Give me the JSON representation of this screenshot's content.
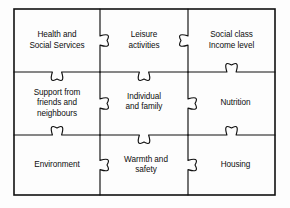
{
  "diagram": {
    "type": "jigsaw-puzzle",
    "rows": 3,
    "columns": 3,
    "frame": {
      "x": 14,
      "y": 9,
      "width": 261,
      "height": 186
    },
    "colors": {
      "stroke": "#111111",
      "background": "#ffffff",
      "text": "#0d0d0d"
    },
    "column_dividers_x": [
      100,
      188
    ],
    "row_dividers_y": [
      72,
      135
    ],
    "pieces": [
      {
        "id": "health-and-social-services",
        "label": "Health and\nSocial Services",
        "row": 0,
        "col": 0,
        "edges": {
          "top": "flat",
          "right": "tab",
          "bottom": "tab",
          "left": "flat"
        }
      },
      {
        "id": "leisure-activities",
        "label": "Leisure\nactivities",
        "row": 0,
        "col": 1,
        "edges": {
          "top": "flat",
          "right": "blank",
          "bottom": "tab",
          "left": "blank"
        }
      },
      {
        "id": "social-class-income-level",
        "label": "Social class\nIncome level",
        "row": 0,
        "col": 2,
        "edges": {
          "top": "flat",
          "right": "flat",
          "bottom": "blank",
          "left": "tab"
        }
      },
      {
        "id": "support-from-friends-and-neighbours",
        "label": "Support from\nfriends and\nneighbours",
        "row": 1,
        "col": 0,
        "edges": {
          "top": "blank",
          "right": "tab",
          "bottom": "blank",
          "left": "flat"
        }
      },
      {
        "id": "individual-and-family",
        "label": "Individual\nand family",
        "row": 1,
        "col": 1,
        "edges": {
          "top": "blank",
          "right": "tab",
          "bottom": "tab",
          "left": "blank"
        }
      },
      {
        "id": "nutrition",
        "label": "Nutrition",
        "row": 1,
        "col": 2,
        "edges": {
          "top": "blank",
          "right": "flat",
          "bottom": "blank",
          "left": "blank"
        }
      },
      {
        "id": "environment",
        "label": "Environment",
        "row": 2,
        "col": 0,
        "edges": {
          "top": "blank",
          "right": "tab",
          "bottom": "flat",
          "left": "flat"
        }
      },
      {
        "id": "warmth-and-safety",
        "label": "Warmth and\nsafety",
        "row": 2,
        "col": 1,
        "edges": {
          "top": "blank",
          "right": "tab",
          "bottom": "flat",
          "left": "blank"
        }
      },
      {
        "id": "housing",
        "label": "Housing",
        "row": 2,
        "col": 2,
        "edges": {
          "top": "blank",
          "right": "flat",
          "bottom": "flat",
          "left": "blank"
        }
      }
    ]
  }
}
